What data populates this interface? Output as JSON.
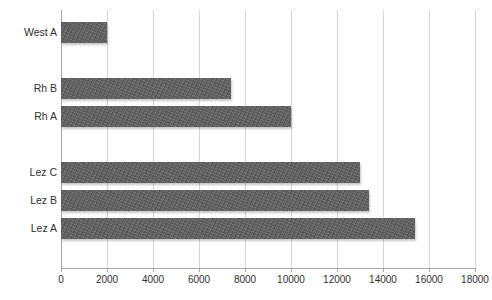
{
  "chart_data": {
    "type": "bar",
    "orientation": "horizontal",
    "title": "",
    "subtitle": "",
    "xlabel": "",
    "ylabel": "",
    "categories": [
      "Lez A",
      "Lez B",
      "Lez C",
      "",
      "Rh A",
      "Rh B",
      "",
      "West A"
    ],
    "values": [
      15400,
      13400,
      13000,
      null,
      10000,
      7400,
      null,
      2000
    ],
    "series": [
      {
        "name": "Series 1",
        "values": [
          15400,
          13400,
          13000,
          null,
          10000,
          7400,
          null,
          2000
        ]
      }
    ],
    "bars": [
      {
        "label": "West A",
        "value": 2000,
        "slot": 0
      },
      {
        "label": "",
        "value": null,
        "slot": 1
      },
      {
        "label": "Rh B",
        "value": 7400,
        "slot": 2
      },
      {
        "label": "Rh A",
        "value": 10000,
        "slot": 3
      },
      {
        "label": "",
        "value": null,
        "slot": 4
      },
      {
        "label": "Lez C",
        "value": 13000,
        "slot": 5
      },
      {
        "label": "Lez B",
        "value": 13400,
        "slot": 6
      },
      {
        "label": "Lez A",
        "value": 15400,
        "slot": 7
      }
    ],
    "xlim": [
      0,
      18000
    ],
    "xticks": [
      0,
      2000,
      4000,
      6000,
      8000,
      10000,
      12000,
      14000,
      16000,
      18000
    ],
    "xtick_labels": [
      "0",
      "2000",
      "4000",
      "6000",
      "8000",
      "10000",
      "12000",
      "14000",
      "16000",
      "18000"
    ],
    "grid": {
      "vertical": true,
      "horizontal": false
    },
    "legend": {
      "visible": false,
      "position": "none"
    },
    "colors": {
      "bar_fill": "#5e5e5e",
      "gridline": "#d4d4d4",
      "axis": "#a8a8a8",
      "text": "#2f2f2f",
      "background": "#ffffff"
    }
  }
}
